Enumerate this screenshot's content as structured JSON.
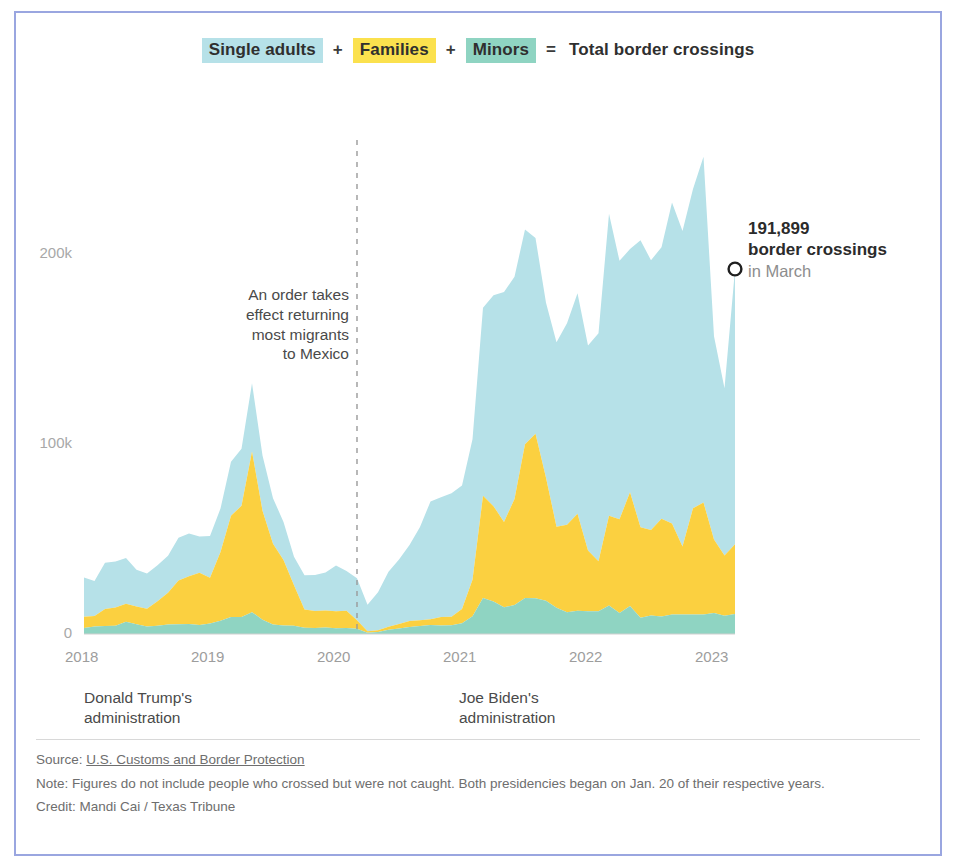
{
  "legend": {
    "item1": "Single adults",
    "op1": "+",
    "item2": "Families",
    "op2": "+",
    "item3": "Minors",
    "op3": "=",
    "total": "Total border crossings",
    "color1": "#b6e1e8",
    "color2": "#fbe14e",
    "color3": "#8fd4c2"
  },
  "annotation": {
    "line1": "An order takes",
    "line2": "effect returning",
    "line3": "most migrants",
    "line4": "to Mexico"
  },
  "callout": {
    "value": "191,899",
    "label": "border crossings",
    "period": "in March",
    "marker": "open-circle"
  },
  "admin": {
    "trump_line1": "Donald Trump's",
    "trump_line2": "administration",
    "biden_line1": "Joe Biden's",
    "biden_line2": "administration"
  },
  "footer": {
    "source_prefix": "Source: ",
    "source_link": "U.S. Customs and Border Protection",
    "note": "Note: Figures do not include people who crossed but were not caught. Both presidencies began on Jan. 20 of their respective years.",
    "credit": "Credit: Mandi Cai / Texas Tribune"
  },
  "chart_data": {
    "type": "area",
    "stacked": true,
    "title": "Total border crossings",
    "xlabel": "",
    "ylabel": "",
    "grid": false,
    "legend_position": "top-center",
    "ylim": [
      0,
      260000
    ],
    "yticks": [
      0,
      100000,
      200000
    ],
    "ytick_labels": [
      "0",
      "100k",
      "200k"
    ],
    "xlim": [
      "2018-01",
      "2023-03"
    ],
    "xticks": [
      "2018",
      "2019",
      "2020",
      "2021",
      "2022",
      "2023"
    ],
    "colors": {
      "single_adults": "#b6e1e8",
      "families": "#fbd040",
      "minors": "#8fd4c2"
    },
    "annotations": [
      {
        "type": "vline",
        "x": "2020-03",
        "style": "dashed",
        "color": "#9a9a9a",
        "text": "An order takes effect returning most migrants to Mexico"
      },
      {
        "type": "point",
        "x": "2023-03",
        "y": 191899,
        "label": "191,899 border crossings in March",
        "marker": "open-circle"
      }
    ],
    "x": [
      "2018-01",
      "2018-02",
      "2018-03",
      "2018-04",
      "2018-05",
      "2018-06",
      "2018-07",
      "2018-08",
      "2018-09",
      "2018-10",
      "2018-11",
      "2018-12",
      "2019-01",
      "2019-02",
      "2019-03",
      "2019-04",
      "2019-05",
      "2019-06",
      "2019-07",
      "2019-08",
      "2019-09",
      "2019-10",
      "2019-11",
      "2019-12",
      "2020-01",
      "2020-02",
      "2020-03",
      "2020-04",
      "2020-05",
      "2020-06",
      "2020-07",
      "2020-08",
      "2020-09",
      "2020-10",
      "2020-11",
      "2020-12",
      "2021-01",
      "2021-02",
      "2021-03",
      "2021-04",
      "2021-05",
      "2021-06",
      "2021-07",
      "2021-08",
      "2021-09",
      "2021-10",
      "2021-11",
      "2021-12",
      "2022-01",
      "2022-02",
      "2022-03",
      "2022-04",
      "2022-05",
      "2022-06",
      "2022-07",
      "2022-08",
      "2022-09",
      "2022-10",
      "2022-11",
      "2022-12",
      "2023-01",
      "2023-02",
      "2023-03"
    ],
    "series": [
      {
        "name": "Minors",
        "values": [
          3200,
          4000,
          4200,
          4400,
          6500,
          5100,
          4000,
          4400,
          5000,
          5100,
          5200,
          4800,
          5500,
          7000,
          9000,
          9000,
          11500,
          7500,
          5000,
          4500,
          4300,
          3300,
          3100,
          3400,
          3000,
          3200,
          2800,
          700,
          1000,
          2200,
          2900,
          3700,
          4200,
          4700,
          4500,
          4600,
          5700,
          9300,
          18900,
          17100,
          14100,
          15200,
          19000,
          18800,
          17500,
          13800,
          11500,
          12300,
          12000,
          12000,
          15000,
          11100,
          14700,
          8600,
          9800,
          9200,
          10200,
          10300,
          10200,
          10300,
          11000,
          9600,
          10500
        ]
      },
      {
        "name": "Families",
        "values": [
          5900,
          5500,
          8900,
          9600,
          9400,
          9400,
          9300,
          12800,
          16700,
          23100,
          25200,
          27500,
          24100,
          36100,
          53200,
          58500,
          84500,
          57400,
          42500,
          34500,
          21300,
          9600,
          9000,
          9000,
          9000,
          9000,
          4500,
          700,
          1000,
          1600,
          2300,
          3100,
          3100,
          3100,
          4500,
          4500,
          7500,
          19200,
          53800,
          50200,
          44900,
          55800,
          80900,
          86600,
          64800,
          42700,
          46000,
          51000,
          31900,
          26300,
          47200,
          49300,
          59900,
          47600,
          44900,
          51400,
          47900,
          35800,
          56000,
          58900,
          38700,
          31700,
          36700
        ]
      },
      {
        "name": "Single adults",
        "values": [
          20700,
          18400,
          24400,
          24200,
          24100,
          19300,
          18500,
          19000,
          19500,
          22400,
          22500,
          19000,
          22000,
          23000,
          28500,
          30000,
          36000,
          29000,
          24000,
          20000,
          15000,
          18000,
          19000,
          20000,
          24000,
          21000,
          22000,
          14000,
          20000,
          29000,
          34000,
          40000,
          49000,
          62000,
          63000,
          65000,
          65000,
          74000,
          99000,
          111000,
          121000,
          117000,
          113000,
          103000,
          92000,
          97000,
          106000,
          116000,
          108000,
          120000,
          159000,
          136000,
          128000,
          151000,
          142000,
          143000,
          169000,
          166000,
          168000,
          182000,
          107000,
          88000,
          144699
        ]
      }
    ],
    "total_values": [
      29800,
      27900,
      37500,
      38200,
      40000,
      33800,
      31800,
      36200,
      41200,
      50600,
      52900,
      51300,
      51600,
      66100,
      90700,
      97500,
      132000,
      93900,
      71500,
      59000,
      40600,
      30900,
      31100,
      32400,
      36000,
      33200,
      29300,
      15400,
      22000,
      32800,
      39200,
      46800,
      56300,
      69800,
      72000,
      74100,
      78200,
      102500,
      171700,
      178300,
      180000,
      188000,
      212900,
      208400,
      174300,
      153500,
      163500,
      179300,
      151900,
      158300,
      221200,
      196400,
      202600,
      207200,
      196700,
      203600,
      227100,
      212100,
      234200,
      251200,
      156700,
      129300,
      191899
    ]
  }
}
